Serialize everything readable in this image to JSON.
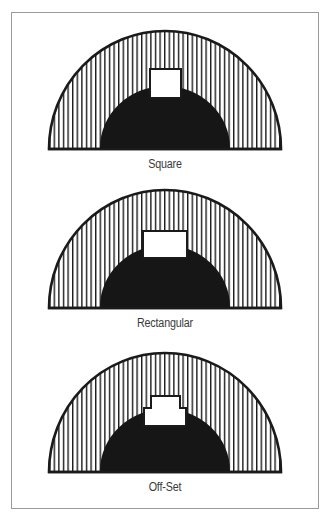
{
  "figure": {
    "panels": [
      {
        "id": "square",
        "label": "Square",
        "opening_shape": "square"
      },
      {
        "id": "rectangular",
        "label": "Rectangular",
        "opening_shape": "rectangle"
      },
      {
        "id": "offset",
        "label": "Off-Set",
        "opening_shape": "stepped"
      }
    ],
    "colors": {
      "outline": "#1a1a1a",
      "hatch": "#1a1a1a",
      "solid_fill": "#161616",
      "opening_fill": "#ffffff",
      "frame_border": "#9a9a9a",
      "label_text": "#3a3a3a"
    },
    "elements": {
      "outer_semicircle": "vertically hatched half-disc",
      "inner_semicircle": "solid black half-disc",
      "opening": "white cutout at top of inner half-disc"
    }
  }
}
